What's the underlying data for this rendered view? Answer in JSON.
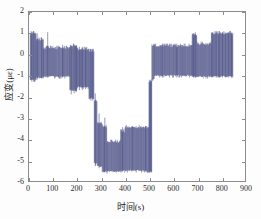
{
  "chart_data": {
    "type": "line",
    "title": "",
    "xlabel": "时间(s)",
    "ylabel": "应变(με)",
    "xlim": [
      0,
      900
    ],
    "ylim": [
      -6,
      2
    ],
    "xticks": [
      0,
      100,
      200,
      300,
      400,
      500,
      600,
      700,
      800,
      900
    ],
    "yticks": [
      2,
      1,
      0,
      -1,
      -2,
      -3,
      -4,
      -5,
      -6
    ],
    "xtick_labels": [
      "0",
      "100",
      "200",
      "300",
      "400",
      "500",
      "600",
      "700",
      "800",
      "900"
    ],
    "ytick_labels": [
      "2",
      "1",
      "0",
      "-1",
      "-2",
      "-3",
      "-4",
      "-5",
      "-6"
    ],
    "grid": false,
    "legend": null,
    "series_color": "#4f5488",
    "axes_color": "#8c8c8c",
    "background": "#ffffff",
    "figure_background": "#fdfdfd",
    "series": [
      {
        "name": "应变",
        "color": "#4f5488",
        "noise_band": true,
        "segments": [
          {
            "x_start": 5,
            "x_end": 30,
            "y_min": -1.25,
            "y_max": 1.05
          },
          {
            "x_start": 30,
            "x_end": 60,
            "y_min": -1.15,
            "y_max": 0.75
          },
          {
            "x_start": 60,
            "x_end": 170,
            "y_min": -1.1,
            "y_max": 0.35
          },
          {
            "x_start": 170,
            "x_end": 200,
            "y_min": -1.75,
            "y_max": 0.45
          },
          {
            "x_start": 200,
            "x_end": 250,
            "y_min": -1.6,
            "y_max": 0.3
          },
          {
            "x_start": 250,
            "x_end": 272,
            "y_min": -2.15,
            "y_max": 0.2
          },
          {
            "x_start": 272,
            "x_end": 285,
            "y_min": -5.2,
            "y_max": -2.1
          },
          {
            "x_start": 285,
            "x_end": 305,
            "y_min": -5.35,
            "y_max": -3.2
          },
          {
            "x_start": 305,
            "x_end": 325,
            "y_min": -5.6,
            "y_max": -3.35
          },
          {
            "x_start": 325,
            "x_end": 382,
            "y_min": -5.6,
            "y_max": -4.1
          },
          {
            "x_start": 382,
            "x_end": 400,
            "y_min": -5.55,
            "y_max": -3.6
          },
          {
            "x_start": 400,
            "x_end": 470,
            "y_min": -5.55,
            "y_max": -3.4
          },
          {
            "x_start": 470,
            "x_end": 500,
            "y_min": -5.55,
            "y_max": -3.4
          },
          {
            "x_start": 500,
            "x_end": 512,
            "y_min": -5.6,
            "y_max": -1.2
          },
          {
            "x_start": 512,
            "x_end": 522,
            "y_min": -1.25,
            "y_max": 0.5
          },
          {
            "x_start": 522,
            "x_end": 680,
            "y_min": -1.05,
            "y_max": 0.45
          },
          {
            "x_start": 680,
            "x_end": 700,
            "y_min": -1.1,
            "y_max": 1.0
          },
          {
            "x_start": 700,
            "x_end": 760,
            "y_min": -1.1,
            "y_max": 0.55
          },
          {
            "x_start": 760,
            "x_end": 850,
            "y_min": -1.1,
            "y_max": 1.05
          }
        ],
        "spikes": [
          {
            "x": 12,
            "y_min": -1.3,
            "y_max": 1.05
          },
          {
            "x": 20,
            "y_min": -1.3,
            "y_max": 1.0
          },
          {
            "x": 34,
            "y_min": -1.2,
            "y_max": 1.0
          },
          {
            "x": 52,
            "y_min": -1.15,
            "y_max": 0.8
          },
          {
            "x": 78,
            "y_min": -1.1,
            "y_max": 1.05
          },
          {
            "x": 140,
            "y_min": -1.1,
            "y_max": 0.45
          },
          {
            "x": 176,
            "y_min": -1.9,
            "y_max": 0.4
          },
          {
            "x": 188,
            "y_min": -1.85,
            "y_max": 0.45
          },
          {
            "x": 196,
            "y_min": -1.8,
            "y_max": 0.4
          },
          {
            "x": 210,
            "y_min": -1.7,
            "y_max": 0.35
          },
          {
            "x": 222,
            "y_min": -1.7,
            "y_max": 0.35
          },
          {
            "x": 236,
            "y_min": -1.65,
            "y_max": 0.3
          },
          {
            "x": 258,
            "y_min": -2.2,
            "y_max": 0.25
          },
          {
            "x": 266,
            "y_min": -2.2,
            "y_max": 0.2
          },
          {
            "x": 276,
            "y_min": -5.3,
            "y_max": -1.85
          },
          {
            "x": 292,
            "y_min": -5.4,
            "y_max": -2.8
          },
          {
            "x": 316,
            "y_min": -5.6,
            "y_max": -3.0
          },
          {
            "x": 390,
            "y_min": -5.55,
            "y_max": -3.45
          },
          {
            "x": 430,
            "y_min": -5.5,
            "y_max": -3.4
          },
          {
            "x": 486,
            "y_min": -5.55,
            "y_max": -3.4
          },
          {
            "x": 504,
            "y_min": -5.6,
            "y_max": -1.35
          },
          {
            "x": 508,
            "y_min": -5.55,
            "y_max": -1.2
          },
          {
            "x": 556,
            "y_min": -1.1,
            "y_max": 0.5
          },
          {
            "x": 616,
            "y_min": -1.1,
            "y_max": 0.5
          },
          {
            "x": 686,
            "y_min": -1.1,
            "y_max": 1.0
          },
          {
            "x": 694,
            "y_min": -1.1,
            "y_max": 0.95
          },
          {
            "x": 766,
            "y_min": -1.1,
            "y_max": 1.05
          },
          {
            "x": 780,
            "y_min": -1.1,
            "y_max": 1.05
          },
          {
            "x": 792,
            "y_min": -1.1,
            "y_max": 1.0
          },
          {
            "x": 806,
            "y_min": -1.1,
            "y_max": 1.05
          },
          {
            "x": 818,
            "y_min": -1.1,
            "y_max": 1.0
          },
          {
            "x": 832,
            "y_min": -1.1,
            "y_max": 1.05
          },
          {
            "x": 844,
            "y_min": -1.1,
            "y_max": 1.0
          }
        ]
      }
    ]
  }
}
